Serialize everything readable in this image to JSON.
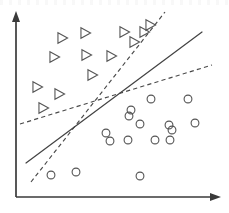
{
  "chart_data": {
    "type": "scatter",
    "title": "",
    "subtitle": "",
    "xlabel": "",
    "ylabel": "",
    "xlim": [
      0,
      229
    ],
    "ylim": [
      213,
      0
    ],
    "grid": false,
    "legend": "none",
    "axes": {
      "y_axis": {
        "x": 16,
        "y_top": 14,
        "y_bottom": 197,
        "arrow": "up",
        "label": ""
      },
      "x_axis": {
        "y": 197,
        "x_left": 16,
        "x_right": 219,
        "arrow": "right",
        "label": ""
      }
    },
    "series": [
      {
        "name": "class-triangle",
        "marker": "triangle-right",
        "marker_size": 9,
        "count": 13,
        "points": [
          {
            "x": 62,
            "y": 38
          },
          {
            "x": 85,
            "y": 33
          },
          {
            "x": 124,
            "y": 32
          },
          {
            "x": 144,
            "y": 32
          },
          {
            "x": 54,
            "y": 57
          },
          {
            "x": 86,
            "y": 55
          },
          {
            "x": 134,
            "y": 42
          },
          {
            "x": 111,
            "y": 56
          },
          {
            "x": 92,
            "y": 75
          },
          {
            "x": 37,
            "y": 87
          },
          {
            "x": 59,
            "y": 94
          },
          {
            "x": 43,
            "y": 108
          },
          {
            "x": 150,
            "y": 25
          }
        ]
      },
      {
        "name": "class-circle",
        "marker": "circle",
        "marker_size": 5,
        "count": 16,
        "points": [
          {
            "x": 151,
            "y": 99
          },
          {
            "x": 188,
            "y": 99
          },
          {
            "x": 129,
            "y": 116
          },
          {
            "x": 131,
            "y": 110
          },
          {
            "x": 140,
            "y": 124
          },
          {
            "x": 169,
            "y": 125
          },
          {
            "x": 195,
            "y": 123
          },
          {
            "x": 110,
            "y": 141
          },
          {
            "x": 128,
            "y": 140
          },
          {
            "x": 155,
            "y": 140
          },
          {
            "x": 170,
            "y": 140
          },
          {
            "x": 172,
            "y": 130
          },
          {
            "x": 51,
            "y": 175
          },
          {
            "x": 76,
            "y": 172
          },
          {
            "x": 140,
            "y": 176
          },
          {
            "x": 106,
            "y": 133
          }
        ]
      }
    ],
    "boundaries": [
      {
        "name": "solid-boundary",
        "style": "solid",
        "x1": 26,
        "y1": 163,
        "x2": 202,
        "y2": 32
      },
      {
        "name": "steep-dashed-boundary",
        "style": "dashed",
        "x1": 31,
        "y1": 182,
        "x2": 165,
        "y2": 12
      },
      {
        "name": "shallow-dashed-boundary",
        "style": "dashed",
        "x1": 20,
        "y1": 124,
        "x2": 212,
        "y2": 65
      }
    ],
    "intersection_region": {
      "x": 107,
      "y": 89
    }
  },
  "figure": {
    "caption": ""
  }
}
